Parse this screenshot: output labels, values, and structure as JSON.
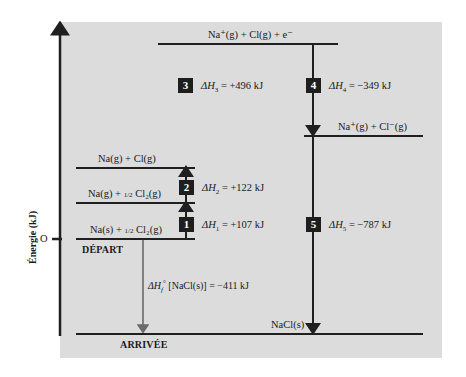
{
  "diagram": {
    "type": "born-haber-cycle",
    "axis": {
      "title": "Énergie (kJ)",
      "zero_label": "O"
    },
    "markers": {
      "start": "DÉPART",
      "end": "ARRIVÉE"
    },
    "levels": [
      {
        "id": "na_plus_cl_e",
        "label": "Na⁺(g) + Cl(g) + e⁻"
      },
      {
        "id": "na_plus_cl_minus",
        "label": "Na⁺(g) + Cl⁻(g)"
      },
      {
        "id": "na_cl_gas",
        "label": "Na(g) + Cl(g)"
      },
      {
        "id": "na_gas_half_cl2",
        "label_prefix": "Na(g) + ",
        "frac": "1/2",
        "label_suffix": " Cl₂(g)"
      },
      {
        "id": "na_solid_half_cl2",
        "label_prefix": "Na(s) + ",
        "frac": "1/2",
        "label_suffix": " Cl₂(g)"
      },
      {
        "id": "nacl_solid",
        "label": "NaCl(s)"
      }
    ],
    "steps": [
      {
        "num": "1",
        "symbol": "ΔH",
        "sub": "1",
        "value": " = +107 kJ"
      },
      {
        "num": "2",
        "symbol": "ΔH",
        "sub": "2",
        "value": " = +122 kJ"
      },
      {
        "num": "3",
        "symbol": "ΔH",
        "sub": "3",
        "value": " = +496 kJ"
      },
      {
        "num": "4",
        "symbol": "ΔH",
        "sub": "4",
        "value": " = −349 kJ"
      },
      {
        "num": "5",
        "symbol": "ΔH",
        "sub": "5",
        "value": " = −787 kJ"
      }
    ],
    "formation": {
      "symbol": "ΔH",
      "sub": "f",
      "sup": "°",
      "value": " [NaCl(s)] = −411 kJ"
    }
  },
  "colors": {
    "panel": "#dcdcdc",
    "line": "#1f1f1f",
    "formation_arrow": "#6a6a6a",
    "badge": "#1e1e1e"
  }
}
